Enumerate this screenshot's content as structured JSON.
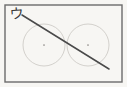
{
  "figure": {
    "kind": "scanned-geometry-diagram",
    "width": 127,
    "height": 87,
    "background_color": "#fdfdfc",
    "paper_tint": "#f7f6f3"
  },
  "frame": {
    "name": "outer-rectangle-frame",
    "stroke_color": "#6b6b6b",
    "stroke_width": 1.4,
    "x": 5,
    "y": 5,
    "width": 117,
    "height": 77
  },
  "label": {
    "text": "ウ",
    "reading": "u",
    "script": "katakana",
    "color": "#3a3a3a",
    "x": 9,
    "y": 6
  },
  "diagonal_line": {
    "name": "diagonal-line",
    "stroke_color": "#4a4a4a",
    "stroke_width": 1.5,
    "x1": 22,
    "y1": 15,
    "x2": 109,
    "y2": 69
  },
  "circles": [
    {
      "name": "left-circle",
      "cx": 44,
      "cy": 45,
      "r": 21,
      "stroke_color": "#c9c6c2",
      "stroke_width": 0.8,
      "center_dot": true,
      "center_dot_color": "#8d8a86"
    },
    {
      "name": "right-circle",
      "cx": 88,
      "cy": 45,
      "r": 21,
      "stroke_color": "#c9c6c2",
      "stroke_width": 0.8,
      "center_dot": true,
      "center_dot_color": "#8d8a86"
    }
  ],
  "annotations": {
    "circle_count": 2,
    "intersection_x": 66,
    "line_label": "diagonal through both circles"
  }
}
